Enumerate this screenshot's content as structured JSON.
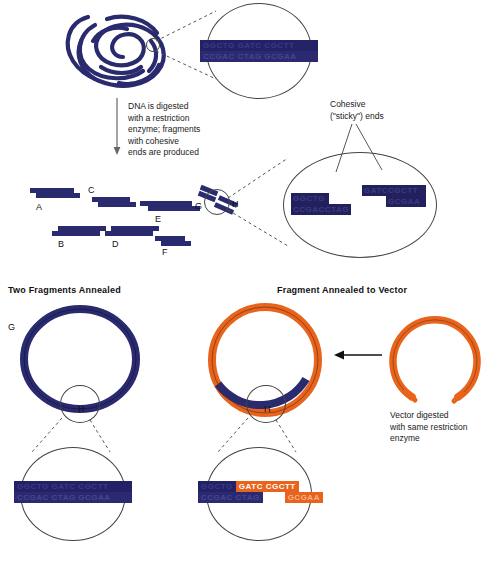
{
  "figure": {
    "colors": {
      "dna_navy": "#2a2a6e",
      "vector_orange": "#e8631c",
      "seq_navy_bg": "#232266",
      "seq_orange_bg": "#e8631c",
      "line": "#444444"
    }
  },
  "top": {
    "coil_label": "supercoiled-dna",
    "magnified_sequence": {
      "top_strand": "GGCTG GATC CGCTT",
      "bottom_strand": "CCGAC CTAG GCGAA"
    }
  },
  "arrow_caption": "DNA is digested\nwith a restriction\nenzyme; fragments\nwith cohesive\nends are produced",
  "sticky": {
    "label": "Cohesive\n(\"sticky\") ends",
    "left_fragment": {
      "top_strand": "GGCTG",
      "bottom_strand": "CCGACCTAG"
    },
    "right_fragment": {
      "top_strand": "GATCCGCTT",
      "bottom_strand": "GCGAA"
    }
  },
  "fragments": [
    {
      "id": "A",
      "label": "A"
    },
    {
      "id": "B",
      "label": "B"
    },
    {
      "id": "C",
      "label": "C"
    },
    {
      "id": "D",
      "label": "D"
    },
    {
      "id": "E",
      "label": "E"
    },
    {
      "id": "F",
      "label": "F"
    },
    {
      "id": "G",
      "label": "G"
    },
    {
      "id": "H",
      "label": "H"
    }
  ],
  "panels": {
    "left": {
      "heading": "Two Fragments Annealed",
      "ring_label_g": "G",
      "ring_label_h": "H",
      "zoom_sequence": {
        "top_strand": "GGCTG GATC CGCTT",
        "bottom_strand": "CCGAC CTAG GCGAA"
      }
    },
    "right": {
      "heading": "Fragment Annealed to Vector",
      "ring_label_h": "H",
      "zoom_sequence": {
        "top_left": "GGCTG",
        "top_mid": "GATC CGCTT",
        "bottom_left": "CCGAC CTAG",
        "bottom_right": "GCGAA"
      },
      "vector_caption": "Vector digested\nwith same restriction\nenzyme"
    }
  }
}
